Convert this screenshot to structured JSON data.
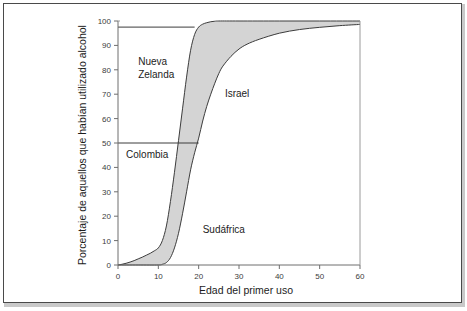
{
  "figure": {
    "background_color": "#ffffff",
    "frame_color": "#4a4a4a",
    "band_fill_color": "#d4d4d4",
    "curve_color": "#3c3c3c",
    "axis_color": "#6e6e6e"
  },
  "chart_data": {
    "type": "area",
    "title": "",
    "subtitle": "",
    "xlabel": "Edad del primer uso",
    "ylabel": "Porcentaje de aquellos que habían utilizado alcohol",
    "xlim": [
      0,
      60
    ],
    "ylim": [
      0,
      100
    ],
    "xticks": [
      0,
      10,
      20,
      30,
      40,
      50,
      60
    ],
    "xtick_labels": [
      "0",
      "10",
      "20",
      "30",
      "40",
      "50",
      "60"
    ],
    "yticks": [
      0,
      10,
      20,
      30,
      40,
      50,
      60,
      70,
      80,
      90,
      100
    ],
    "ytick_labels": [
      "0",
      "10",
      "20",
      "30",
      "40",
      "50",
      "60",
      "70",
      "80",
      "90",
      "100"
    ],
    "grid": false,
    "legend_position": "none",
    "series": [
      {
        "name": "Curva superior (inicio más temprano)",
        "x": [
          0,
          1,
          2,
          3,
          4,
          5,
          6,
          7,
          8,
          9,
          10,
          11,
          12,
          13,
          14,
          15,
          16,
          17,
          18,
          19,
          20,
          21,
          22,
          23,
          24,
          25,
          30,
          40,
          50,
          60
        ],
        "values": [
          0,
          0.3,
          0.7,
          1.2,
          1.8,
          2.5,
          3.2,
          4.0,
          4.8,
          5.8,
          7.0,
          10.0,
          16.0,
          26.0,
          38.0,
          51.0,
          64.0,
          77.0,
          88.0,
          94.5,
          97.5,
          98.7,
          99.3,
          99.7,
          99.9,
          100,
          100,
          100,
          100,
          100
        ]
      },
      {
        "name": "Curva inferior (inicio más tardío)",
        "x": [
          0,
          5,
          10,
          11,
          12,
          13,
          14,
          15,
          16,
          17,
          18,
          19,
          20,
          21,
          22,
          23,
          24,
          25,
          26,
          28,
          30,
          32,
          35,
          40,
          45,
          50,
          55,
          60
        ],
        "values": [
          0,
          0,
          0,
          0.3,
          1.0,
          3.0,
          7.0,
          13.0,
          21.0,
          30.0,
          39.0,
          46.0,
          52.0,
          59.0,
          65.0,
          70.0,
          74.5,
          78.5,
          81.5,
          85.5,
          88.5,
          90.5,
          92.5,
          95.0,
          96.5,
          97.4,
          98.1,
          98.6
        ]
      }
    ],
    "reference_lines": [
      {
        "name": "linea-referencia-superior",
        "orientation": "horizontal",
        "y": 97.5,
        "x_start": 0,
        "x_end": 19
      },
      {
        "name": "linea-referencia-mediana",
        "orientation": "horizontal",
        "y": 50,
        "x_start": 0,
        "x_end": 20
      }
    ],
    "annotations": [
      {
        "name": "nueva-zelanda",
        "lines": [
          "Nueva",
          "Zelanda"
        ],
        "x": 5.0,
        "y": 82
      },
      {
        "name": "colombia",
        "lines": [
          "Colombia"
        ],
        "x": 2.0,
        "y": 44
      },
      {
        "name": "israel",
        "lines": [
          "Israel"
        ],
        "x": 26.5,
        "y": 69
      },
      {
        "name": "sudafrica",
        "lines": [
          "Sudáfrica"
        ],
        "x": 21.0,
        "y": 13
      }
    ]
  }
}
